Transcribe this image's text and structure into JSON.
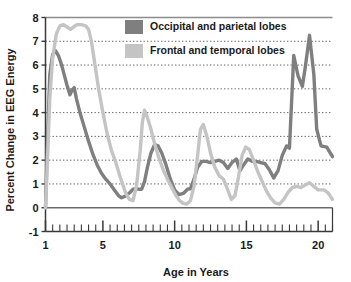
{
  "chart_data": {
    "type": "line",
    "title": "",
    "xlabel": "Age in Years",
    "ylabel": "Percent Change in EEG Energy",
    "xlim": [
      1,
      21
    ],
    "ylim": [
      -1,
      8
    ],
    "ytick_labels": [
      "8",
      "7",
      "6",
      "5",
      "4",
      "3",
      "2",
      "1",
      "0",
      "-1"
    ],
    "ytick_values": [
      8,
      7,
      6,
      5,
      4,
      3,
      2,
      1,
      0,
      -1
    ],
    "xtick_labels": [
      "1",
      "5",
      "10",
      "15",
      "20"
    ],
    "xtick_values": [
      1,
      5,
      10,
      15,
      20
    ],
    "minor_xtick_step": 0.5,
    "grid": "horizontal-dotted",
    "legend_position": "top-center",
    "series": [
      {
        "name": "Occipital and parietal lobes",
        "color": "#7f7f7f",
        "x": [
          1.0,
          1.15,
          1.3,
          1.5,
          1.7,
          1.9,
          2.1,
          2.3,
          2.5,
          2.7,
          2.85,
          3.0,
          3.15,
          3.4,
          3.7,
          4.0,
          4.3,
          4.6,
          4.9,
          5.2,
          5.5,
          5.8,
          6.1,
          6.3,
          6.6,
          6.9,
          7.1,
          7.3,
          7.5,
          7.7,
          7.9,
          8.1,
          8.35,
          8.6,
          8.85,
          9.1,
          9.4,
          9.7,
          10.0,
          10.3,
          10.6,
          10.9,
          11.1,
          11.35,
          11.6,
          11.9,
          12.2,
          12.5,
          12.8,
          13.1,
          13.4,
          13.7,
          14.0,
          14.3,
          14.55,
          14.8,
          15.1,
          15.4,
          15.7,
          16.0,
          16.3,
          16.6,
          16.9,
          17.2,
          17.5,
          17.8,
          18.0,
          18.3,
          18.6,
          18.9,
          19.1,
          19.4,
          19.7,
          19.9,
          20.2,
          20.6,
          21.0
        ],
        "y": [
          0.0,
          3.0,
          5.6,
          6.45,
          6.6,
          6.4,
          6.05,
          5.6,
          5.15,
          4.75,
          4.95,
          5.05,
          4.6,
          4.0,
          3.4,
          2.8,
          2.25,
          1.8,
          1.45,
          1.2,
          1.0,
          0.75,
          0.5,
          0.42,
          0.5,
          0.65,
          0.78,
          0.8,
          0.78,
          0.78,
          1.1,
          1.7,
          2.3,
          2.65,
          2.6,
          2.3,
          1.8,
          1.2,
          0.75,
          0.55,
          0.6,
          0.78,
          0.8,
          1.2,
          1.7,
          1.95,
          1.95,
          1.9,
          1.95,
          2.0,
          1.9,
          1.65,
          1.9,
          2.05,
          1.55,
          1.8,
          2.05,
          1.95,
          1.95,
          1.9,
          1.85,
          1.6,
          1.25,
          1.55,
          2.2,
          2.6,
          2.5,
          6.4,
          5.55,
          5.1,
          5.9,
          7.25,
          5.6,
          3.3,
          2.6,
          2.55,
          2.15
        ]
      },
      {
        "name": "Frontal and temporal lobes",
        "color": "#c4c4c4",
        "x": [
          1.0,
          1.15,
          1.3,
          1.5,
          1.75,
          2.0,
          2.25,
          2.5,
          2.75,
          2.95,
          3.2,
          3.5,
          3.8,
          4.0,
          4.2,
          4.45,
          4.7,
          5.0,
          5.3,
          5.6,
          5.9,
          6.15,
          6.4,
          6.6,
          6.85,
          7.1,
          7.35,
          7.6,
          7.75,
          7.9,
          8.1,
          8.35,
          8.6,
          8.9,
          9.2,
          9.5,
          9.8,
          10.1,
          10.35,
          10.6,
          10.85,
          11.1,
          11.35,
          11.6,
          11.8,
          12.0,
          12.25,
          12.5,
          12.8,
          13.1,
          13.4,
          13.7,
          13.95,
          14.2,
          14.45,
          14.7,
          14.95,
          15.2,
          15.5,
          15.8,
          16.1,
          16.4,
          16.7,
          17.0,
          17.3,
          17.6,
          17.9,
          18.2,
          18.5,
          18.8,
          19.1,
          19.4,
          19.7,
          20.0,
          20.4,
          20.7,
          21.0
        ],
        "y": [
          0.0,
          2.2,
          4.6,
          6.3,
          7.3,
          7.65,
          7.7,
          7.6,
          7.5,
          7.6,
          7.7,
          7.7,
          7.65,
          7.5,
          7.0,
          6.0,
          5.0,
          4.0,
          3.1,
          2.4,
          1.9,
          1.4,
          0.95,
          0.6,
          0.35,
          0.3,
          0.95,
          2.4,
          3.6,
          4.1,
          3.8,
          3.3,
          2.7,
          2.1,
          1.6,
          1.2,
          0.85,
          0.5,
          0.3,
          0.18,
          0.15,
          0.3,
          0.9,
          2.2,
          3.3,
          3.5,
          3.0,
          2.3,
          1.7,
          1.35,
          1.2,
          0.75,
          0.35,
          0.5,
          1.3,
          2.2,
          2.55,
          2.45,
          2.0,
          1.5,
          1.1,
          0.7,
          0.4,
          0.2,
          0.15,
          0.35,
          0.65,
          0.85,
          0.9,
          0.85,
          0.95,
          1.05,
          0.9,
          0.75,
          0.75,
          0.62,
          0.35
        ]
      }
    ]
  },
  "legend": {
    "items": [
      {
        "label": "Occipital and parietal lobes",
        "color": "#7f7f7f"
      },
      {
        "label": "Frontal and temporal lobes",
        "color": "#c4c4c4"
      }
    ]
  }
}
